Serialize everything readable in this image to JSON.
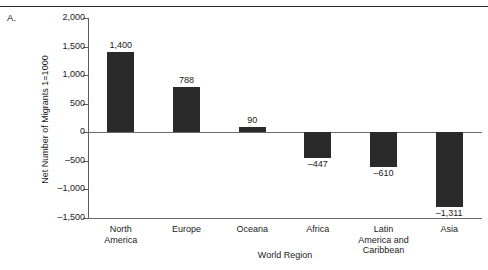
{
  "figure": {
    "panel_label": "A.",
    "has_top_rule": true
  },
  "chart_data": {
    "type": "bar",
    "title": "",
    "subtitle": "",
    "panel": "A.",
    "xlabel": "World Region",
    "ylabel": "Net Number of Migrants 1=1000",
    "categories": [
      "North America",
      "Europe",
      "Oceana",
      "Africa",
      "Latin America and Caribbean",
      "Asia"
    ],
    "category_lines": [
      [
        "North",
        "America"
      ],
      [
        "Europe"
      ],
      [
        "Oceana"
      ],
      [
        "Africa"
      ],
      [
        "Latin",
        "America and",
        "Caribbean"
      ],
      [
        "Asia"
      ]
    ],
    "values": [
      1400,
      788,
      90,
      -447,
      -610,
      -1311
    ],
    "value_labels": [
      "1,400",
      "788",
      "90",
      "–447",
      "–610",
      "–1,311"
    ],
    "ylim": [
      -1500,
      2000
    ],
    "yticks": [
      2000,
      1500,
      1000,
      500,
      0,
      -500,
      -1000,
      -1500
    ],
    "ytick_labels": [
      "2,000",
      "1,500",
      "1,000",
      "500",
      "0",
      "–500",
      "–1,000",
      "–1,500"
    ],
    "grid": false,
    "legend": null,
    "bar_color": "#2a2a2a",
    "axis_color": "#5d5d5d",
    "baseline_color": "#6a6a6a",
    "background": "#ffffff"
  }
}
